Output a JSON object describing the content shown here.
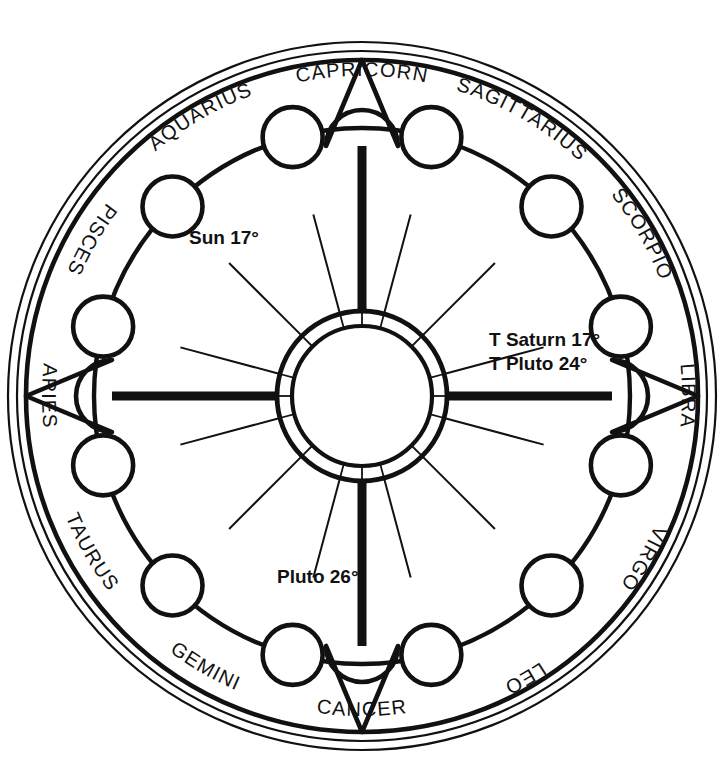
{
  "chart_data": {
    "type": "pie",
    "xlabel": "",
    "ylabel": "",
    "legend_position": "none",
    "grid": false,
    "categories": [
      "SAGITTARIUS",
      "SCORPIO",
      "LIBRA",
      "VIRGO",
      "LEO",
      "CANCER",
      "GEMINI",
      "TAURUS",
      "ARIES",
      "PISCES",
      "AQUARIUS",
      "CAPRICORN"
    ],
    "values": [
      30,
      30,
      30,
      30,
      30,
      30,
      30,
      30,
      30,
      30,
      30,
      30
    ],
    "annotations": [
      {
        "text": "Sun 17°",
        "sign": "AQUARIUS",
        "degree": 17
      },
      {
        "text": "T Saturn 17°",
        "sign": "LIBRA",
        "degree": 17
      },
      {
        "text": "T Pluto 24°",
        "sign": "LIBRA",
        "degree": 24
      },
      {
        "text": "Pluto 26°",
        "sign": "TAURUS",
        "degree": 26
      }
    ]
  },
  "wheel": {
    "center": {
      "x": 362,
      "y": 396
    },
    "radii": {
      "outer_thin_1": 354,
      "outer_thin_2": 345,
      "main_rim": 336,
      "inner_band": 268,
      "hub_outer": 85,
      "hub_inner": 70,
      "planet_orbit": 218,
      "planet_circle": 30
    },
    "signs": [
      {
        "name": "SAGITTARIUS",
        "angle": -60,
        "flip": false
      },
      {
        "name": "SCORPIO",
        "angle": -30,
        "flip": false
      },
      {
        "name": "LIBRA",
        "angle": 0,
        "flip": false
      },
      {
        "name": "VIRGO",
        "angle": 30,
        "flip": false
      },
      {
        "name": "LEO",
        "angle": 60,
        "flip": false
      },
      {
        "name": "CANCER",
        "angle": 90,
        "flip": true
      },
      {
        "name": "GEMINI",
        "angle": 120,
        "flip": true
      },
      {
        "name": "TAURUS",
        "angle": 150,
        "flip": true
      },
      {
        "name": "ARIES",
        "angle": 180,
        "flip": true
      },
      {
        "name": "PISCES",
        "angle": 210,
        "flip": true
      },
      {
        "name": "AQUARIUS",
        "angle": 240,
        "flip": false
      },
      {
        "name": "CAPRICORN",
        "angle": 270,
        "flip": false
      }
    ],
    "planet_nodes": [
      {
        "angle": -75
      },
      {
        "angle": -45
      },
      {
        "angle": -15
      },
      {
        "angle": 15
      },
      {
        "angle": 45
      },
      {
        "angle": 75
      },
      {
        "angle": 105
      },
      {
        "angle": 135
      },
      {
        "angle": 165
      },
      {
        "angle": 195
      },
      {
        "angle": 225
      },
      {
        "angle": 255
      }
    ],
    "cardinal_pointers": [
      0,
      90,
      180,
      270
    ],
    "labels": {
      "sun": "Sun 17°",
      "saturn": "T Saturn 17°",
      "pluto_transit": "T Pluto 24°",
      "pluto_natal": "Pluto 26°"
    },
    "label_positions": {
      "sun": {
        "x": 189,
        "y": 239
      },
      "saturn": {
        "x": 489,
        "y": 341
      },
      "pluto_transit": {
        "x": 489,
        "y": 365
      },
      "pluto_natal": {
        "x": 277,
        "y": 578
      }
    },
    "colors": {
      "ink": "#111111",
      "paper": "#ffffff"
    }
  }
}
